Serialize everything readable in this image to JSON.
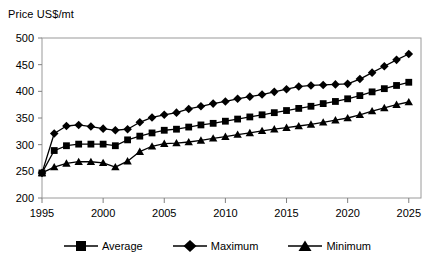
{
  "chart_data": {
    "type": "line",
    "title": "",
    "ylabel": "Price US$/mt",
    "xlabel": "",
    "ylim": [
      200,
      500
    ],
    "yticks": [
      200,
      250,
      300,
      350,
      400,
      450,
      500
    ],
    "xlim": [
      1995,
      2026
    ],
    "xticks": [
      1995,
      2000,
      2005,
      2010,
      2015,
      2020,
      2025
    ],
    "grid": false,
    "legend_position": "bottom",
    "x": [
      1995,
      1996,
      1997,
      1998,
      1999,
      2000,
      2001,
      2002,
      2003,
      2004,
      2005,
      2006,
      2007,
      2008,
      2009,
      2010,
      2011,
      2012,
      2013,
      2014,
      2015,
      2016,
      2017,
      2018,
      2019,
      2020,
      2021,
      2022,
      2023,
      2024,
      2025
    ],
    "series": [
      {
        "name": "Average",
        "marker": "square",
        "values": [
          247,
          289,
          298,
          301,
          301,
          301,
          298,
          309,
          316,
          322,
          327,
          329,
          333,
          337,
          340,
          344,
          348,
          352,
          356,
          360,
          364,
          368,
          372,
          377,
          381,
          386,
          392,
          399,
          405,
          411,
          417
        ]
      },
      {
        "name": "Maximum",
        "marker": "diamond",
        "values": [
          247,
          321,
          335,
          337,
          334,
          330,
          327,
          329,
          342,
          351,
          356,
          360,
          367,
          372,
          377,
          381,
          386,
          390,
          394,
          399,
          404,
          409,
          411,
          412,
          413,
          414,
          423,
          435,
          447,
          459,
          470
        ]
      },
      {
        "name": "Minimum",
        "marker": "triangle",
        "values": [
          247,
          258,
          265,
          268,
          268,
          266,
          258,
          269,
          287,
          297,
          302,
          303,
          305,
          308,
          312,
          315,
          319,
          322,
          326,
          329,
          332,
          335,
          338,
          342,
          346,
          350,
          356,
          363,
          369,
          375,
          380
        ]
      }
    ]
  },
  "legend": {
    "items": [
      {
        "label": "Average"
      },
      {
        "label": "Maximum"
      },
      {
        "label": "Minimum"
      }
    ]
  },
  "colors": {
    "series": "#000000",
    "axis": "#808080",
    "plot_border": "#9a9a9a",
    "background": "#ffffff"
  }
}
